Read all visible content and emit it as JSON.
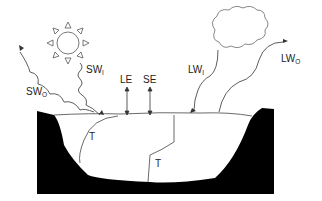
{
  "diagram": {
    "labels": {
      "sw_in": {
        "main": "SW",
        "sub": "I"
      },
      "sw_out": {
        "main": "SW",
        "sub": "O"
      },
      "lw_in": {
        "main": "LW",
        "sub": "I"
      },
      "lw_out": {
        "main": "LW",
        "sub": "O"
      },
      "le": "LE",
      "se": "SE",
      "t1": "T",
      "t2": "T"
    },
    "icons": [
      "sun-icon",
      "cloud-icon"
    ],
    "colors": {
      "ground": "#000000",
      "water": "#ffffff",
      "lines": "#333333"
    }
  }
}
